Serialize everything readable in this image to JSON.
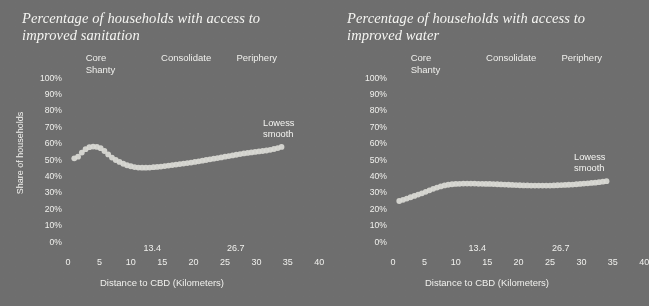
{
  "background_color": "#6e6e6e",
  "ink_color": "#f0f0ed",
  "marker_color": "#d9d9d4",
  "panels": [
    {
      "id": "sanitation",
      "title": "Percentage of households with access to improved sanitation",
      "y_axis_label": "Share of households",
      "x_axis_label": "Distance to CBD (Kilometers)",
      "series_annotation": "Lowess\nsmooth",
      "region_labels": [
        {
          "text": "Core\nShanty",
          "x_km": 6.0
        },
        {
          "text": "Consolidate",
          "x_km": 18.0
        },
        {
          "text": "Periphery",
          "x_km": 30.0
        }
      ]
    },
    {
      "id": "water",
      "title": "Percentage of households with access to improved water",
      "y_axis_label": "",
      "x_axis_label": "Distance to CBD (Kilometers)",
      "series_annotation": "Lowess\nsmooth",
      "region_labels": [
        {
          "text": "Core\nShanty",
          "x_km": 6.0
        },
        {
          "text": "Consolidate",
          "x_km": 18.0
        },
        {
          "text": "Periphery",
          "x_km": 30.0
        }
      ]
    }
  ],
  "chart_data": [
    {
      "type": "scatter",
      "id": "sanitation",
      "title": "Percentage of households with access to improved sanitation",
      "xlabel": "Distance to CBD (Kilometers)",
      "ylabel": "Share of households",
      "xlim": [
        0,
        40
      ],
      "ylim": [
        0,
        100
      ],
      "grid": false,
      "legend": "none",
      "xticks": [
        0,
        5,
        10,
        15,
        20,
        25,
        30,
        35,
        40
      ],
      "xticks_extra": [
        13.4,
        26.7
      ],
      "yticks": [
        0,
        10,
        20,
        30,
        40,
        50,
        60,
        70,
        80,
        90,
        100
      ],
      "ytick_labels": [
        "0%",
        "10%",
        "20%",
        "30%",
        "40%",
        "50%",
        "60%",
        "70%",
        "80%",
        "90%",
        "100%"
      ],
      "series": [
        {
          "name": "Lowess smooth",
          "x": [
            1.0,
            1.6,
            2.2,
            2.8,
            3.4,
            4.0,
            4.6,
            5.2,
            5.8,
            6.4,
            7.0,
            7.6,
            8.2,
            8.8,
            9.4,
            10.0,
            10.6,
            11.2,
            11.8,
            12.4,
            13.0,
            13.6,
            14.2,
            14.8,
            15.4,
            16.0,
            16.6,
            17.2,
            17.8,
            18.4,
            19.0,
            19.6,
            20.2,
            20.8,
            21.4,
            22.0,
            22.6,
            23.2,
            23.8,
            24.4,
            25.0,
            25.6,
            26.2,
            26.8,
            27.4,
            28.0,
            28.6,
            29.2,
            29.8,
            30.4,
            31.0,
            31.6,
            32.2,
            32.8,
            33.4,
            34.0
          ],
          "y": [
            51.0,
            52.0,
            54.5,
            56.6,
            57.8,
            58.2,
            58.0,
            57.2,
            55.5,
            53.4,
            51.5,
            50.0,
            48.8,
            47.7,
            46.8,
            46.2,
            45.7,
            45.4,
            45.3,
            45.3,
            45.4,
            45.6,
            45.8,
            46.0,
            46.3,
            46.6,
            46.9,
            47.2,
            47.5,
            47.8,
            48.1,
            48.4,
            48.8,
            49.2,
            49.6,
            50.0,
            50.4,
            50.8,
            51.2,
            51.6,
            52.0,
            52.4,
            52.8,
            53.2,
            53.6,
            54.0,
            54.3,
            54.6,
            54.9,
            55.2,
            55.5,
            55.8,
            56.2,
            56.7,
            57.3,
            58.0
          ]
        }
      ]
    },
    {
      "type": "scatter",
      "id": "water",
      "title": "Percentage of households with access to improved water",
      "xlabel": "Distance to CBD (Kilometers)",
      "ylabel": "",
      "xlim": [
        0,
        40
      ],
      "ylim": [
        0,
        100
      ],
      "grid": false,
      "legend": "none",
      "xticks": [
        0,
        5,
        10,
        15,
        20,
        25,
        30,
        35,
        40
      ],
      "xticks_extra": [
        13.4,
        26.7
      ],
      "yticks": [
        0,
        10,
        20,
        30,
        40,
        50,
        60,
        70,
        80,
        90,
        100
      ],
      "ytick_labels": [
        "0%",
        "10%",
        "20%",
        "30%",
        "40%",
        "50%",
        "60%",
        "70%",
        "80%",
        "90%",
        "100%"
      ],
      "series": [
        {
          "name": "Lowess smooth",
          "x": [
            1.0,
            1.6,
            2.2,
            2.8,
            3.4,
            4.0,
            4.6,
            5.2,
            5.8,
            6.4,
            7.0,
            7.6,
            8.2,
            8.8,
            9.4,
            10.0,
            10.6,
            11.2,
            11.8,
            12.4,
            13.0,
            13.6,
            14.2,
            14.8,
            15.4,
            16.0,
            16.6,
            17.2,
            17.8,
            18.4,
            19.0,
            19.6,
            20.2,
            20.8,
            21.4,
            22.0,
            22.6,
            23.2,
            23.8,
            24.4,
            25.0,
            25.6,
            26.2,
            26.8,
            27.4,
            28.0,
            28.6,
            29.2,
            29.8,
            30.4,
            31.0,
            31.6,
            32.2,
            32.8,
            33.4,
            34.0
          ],
          "y": [
            25.0,
            25.7,
            26.5,
            27.3,
            28.1,
            28.9,
            29.7,
            30.6,
            31.5,
            32.4,
            33.2,
            33.9,
            34.5,
            34.9,
            35.2,
            35.4,
            35.5,
            35.6,
            35.6,
            35.6,
            35.6,
            35.5,
            35.5,
            35.4,
            35.4,
            35.3,
            35.2,
            35.1,
            35.0,
            34.9,
            34.8,
            34.7,
            34.6,
            34.5,
            34.5,
            34.4,
            34.4,
            34.4,
            34.4,
            34.4,
            34.4,
            34.5,
            34.6,
            34.7,
            34.8,
            34.9,
            35.0,
            35.2,
            35.4,
            35.6,
            35.8,
            36.0,
            36.2,
            36.5,
            36.8,
            37.1
          ]
        }
      ]
    }
  ]
}
